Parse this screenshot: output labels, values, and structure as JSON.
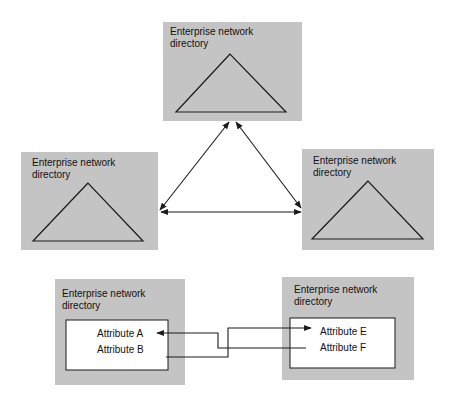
{
  "diagram": {
    "title": "",
    "directories": [
      {
        "id": "top",
        "label_line1": "Enterprise network",
        "label_line2": "directory",
        "content": "tree"
      },
      {
        "id": "left",
        "label_line1": "Enterprise network",
        "label_line2": "directory",
        "content": "tree"
      },
      {
        "id": "right",
        "label_line1": "Enterprise network",
        "label_line2": "directory",
        "content": "tree"
      },
      {
        "id": "bottom-left",
        "label_line1": "Enterprise network",
        "label_line2": "directory",
        "content": "attributes",
        "attributes": [
          "Attribute A",
          "Attribute B"
        ]
      },
      {
        "id": "bottom-right",
        "label_line1": "Enterprise network",
        "label_line2": "directory",
        "content": "attributes",
        "attributes": [
          "Attribute E",
          "Attribute F"
        ]
      }
    ],
    "connections": [
      {
        "from": "top",
        "to": "left",
        "type": "bidirectional"
      },
      {
        "from": "top",
        "to": "right",
        "type": "bidirectional"
      },
      {
        "from": "left",
        "to": "right",
        "type": "bidirectional"
      },
      {
        "from": "Attribute F",
        "to": "Attribute A",
        "type": "directed"
      },
      {
        "from": "Attribute B",
        "to": "Attribute E",
        "type": "directed"
      }
    ],
    "colors": {
      "box_fill": "#c4c4c4",
      "line": "#1a1a1a",
      "inner_fill": "#ffffff"
    }
  }
}
